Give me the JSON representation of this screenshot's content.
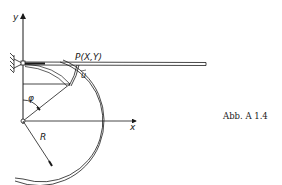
{
  "figure": {
    "caption": "Abb. A 1.4",
    "labels": {
      "y_axis": "y",
      "x_axis": "x",
      "point": "P(X,Y)",
      "displacement": "u",
      "angle": "φ",
      "radius": "R"
    },
    "colors": {
      "ink": "#1a1a1a",
      "background": "#ffffff"
    }
  }
}
